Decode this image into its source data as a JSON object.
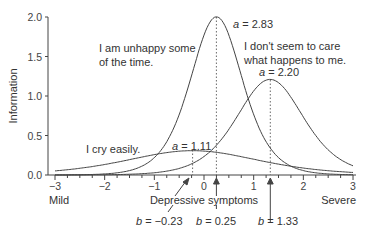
{
  "chart_data": {
    "type": "line",
    "title": "",
    "xlabel": "Depressive symptoms",
    "ylabel": "Information",
    "xlim": [
      -3,
      3
    ],
    "ylim": [
      0,
      2.0
    ],
    "x_ticks": [
      "−3",
      "−2",
      "−1",
      "0",
      "1",
      "2",
      "3"
    ],
    "y_ticks": [
      "0.0",
      "0.5",
      "1.0",
      "1.5",
      "2.0"
    ],
    "x_end_labels": {
      "left": "Mild",
      "right": "Severe"
    },
    "grid": false,
    "legend": "none",
    "series": [
      {
        "name": "I am unhappy some of the time.",
        "a": 2.83,
        "b": 0.25,
        "peak_information": 2.0
      },
      {
        "name": "I don't seem to care what happens to me.",
        "a": 2.2,
        "b": 1.33,
        "peak_information": 1.21
      },
      {
        "name": "I cry easily.",
        "a": 1.11,
        "b": -0.23,
        "peak_information": 0.31
      }
    ],
    "annotations": {
      "a_labels": [
        "a = 2.83",
        "a = 2.20",
        "a = 1.11"
      ],
      "b_labels": [
        "b = −0.23",
        "b = 0.25",
        "b = 1.33"
      ],
      "item_labels": [
        "I am unhappy some",
        "of the time.",
        "I don't seem to care",
        "what happens to me.",
        "I cry easily."
      ]
    }
  },
  "axes": {
    "ylabel": "Information",
    "xlabel": "Depressive symptoms",
    "mild": "Mild",
    "severe": "Severe",
    "yticks": [
      "0.0",
      "0.5",
      "1.0",
      "1.5",
      "2.0"
    ],
    "xticks": [
      "−3",
      "−2",
      "−1",
      "0",
      "1",
      "2",
      "3"
    ]
  },
  "labels": {
    "item1_line1": "I am unhappy some",
    "item1_line2": "of the time.",
    "item2_line1": "I don't seem to care",
    "item2_line2": "what happens to me.",
    "item3": "I cry easily.",
    "a1_var": "a",
    "a1_val": " = 2.83",
    "a2_var": "a",
    "a2_val": " = 2.20",
    "a3_var": "a",
    "a3_val": " = 1.11",
    "b1_var": "b",
    "b1_val": " = −0.23",
    "b2_var": "b",
    "b2_val": " = 0.25",
    "b3_var": "b",
    "b3_val": " = 1.33"
  },
  "colors": {
    "curve": "#444444",
    "axis": "#444444"
  }
}
